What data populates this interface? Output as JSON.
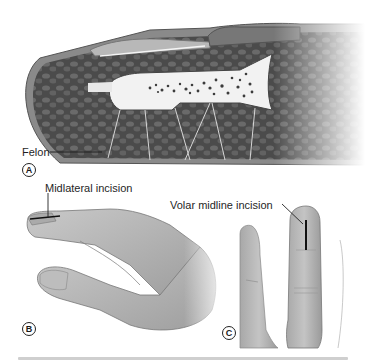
{
  "figure": {
    "panels": [
      {
        "letter": "A",
        "label": "Felon",
        "description": "Sagittal section of distal fingertip showing pulp septae and distal phalanx"
      },
      {
        "letter": "B",
        "label": "Midlateral incision",
        "description": "Lateral view of hand with midlateral incision on fingertip"
      },
      {
        "letter": "C",
        "label": "Volar midline incision",
        "description": "Palmar view of fingers with volar midline incision on fingertip"
      }
    ],
    "colors": {
      "tissue_dark": "#4a4a4a",
      "tissue_mid": "#6e6e6e",
      "bone": "#f2f2f2",
      "skin": "#bdbdbd",
      "incision": "#111111"
    }
  }
}
